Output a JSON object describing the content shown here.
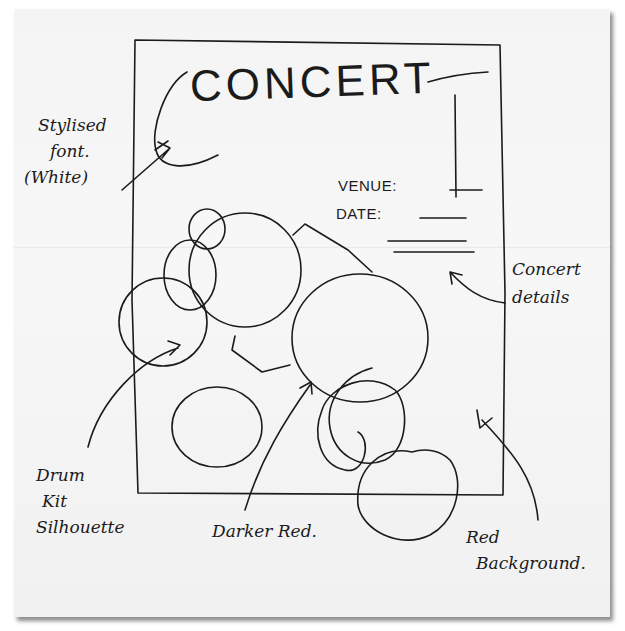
{
  "sketch": {
    "kind": "hand-drawn concert poster wireframe",
    "paper_color": "#f4f4f4",
    "ink_color": "#1b1b1b"
  },
  "poster": {
    "title": "CONCERT",
    "details": {
      "venue_label": "VENUE:",
      "date_label": "DATE:"
    }
  },
  "annotations": {
    "font_note": [
      "Stylised",
      "font.",
      "(White)"
    ],
    "details_note": [
      "Concert",
      "details"
    ],
    "drum_note": [
      "Drum",
      "Kit",
      "Silhouette"
    ],
    "darker_note": "Darker Red.",
    "background_note": [
      "Red",
      "Background."
    ]
  },
  "design_intent": {
    "background_color": "Red",
    "silhouette_color": "Darker Red",
    "title_font_color": "White"
  }
}
